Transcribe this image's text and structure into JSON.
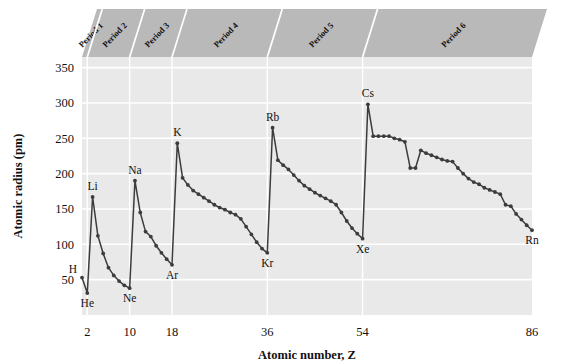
{
  "chart_data": {
    "type": "line",
    "title": "",
    "xlabel": "Atomic number, Z",
    "ylabel": "Atomic radius (pm)",
    "xlim": [
      1,
      86
    ],
    "ylim": [
      0,
      365
    ],
    "xticks": [
      2,
      10,
      18,
      36,
      54,
      86
    ],
    "xtick_labels": [
      "2",
      "10",
      "18",
      "36",
      "54",
      "86"
    ],
    "yticks": [
      50,
      100,
      150,
      200,
      250,
      300,
      350
    ],
    "ytick_labels": [
      "50",
      "100",
      "150",
      "200",
      "250",
      "300",
      "350"
    ],
    "grid": "horizontal-and-period-dividers",
    "legend": "none",
    "marker": "filled-circle",
    "line_color": "#3c3c3c",
    "plot_background": "#e9e9e9",
    "gridline_color": "#ffffff",
    "band_color": "#b9b9b9",
    "x": [
      1,
      2,
      3,
      4,
      5,
      6,
      7,
      8,
      9,
      10,
      11,
      12,
      13,
      14,
      15,
      16,
      17,
      18,
      19,
      20,
      21,
      22,
      23,
      24,
      25,
      26,
      27,
      28,
      29,
      30,
      31,
      32,
      33,
      34,
      35,
      36,
      37,
      38,
      39,
      40,
      41,
      42,
      43,
      44,
      45,
      46,
      47,
      48,
      49,
      50,
      51,
      52,
      53,
      54,
      55,
      56,
      57,
      58,
      59,
      60,
      61,
      62,
      63,
      64,
      65,
      66,
      67,
      68,
      69,
      70,
      71,
      72,
      73,
      74,
      75,
      76,
      77,
      78,
      79,
      80,
      81,
      82,
      83,
      84,
      85,
      86
    ],
    "values": [
      53,
      31,
      167,
      112,
      87,
      67,
      56,
      48,
      42,
      38,
      190,
      145,
      118,
      111,
      98,
      88,
      79,
      71,
      243,
      194,
      184,
      176,
      171,
      166,
      161,
      156,
      152,
      149,
      145,
      142,
      136,
      125,
      114,
      103,
      94,
      88,
      265,
      219,
      212,
      206,
      198,
      190,
      183,
      178,
      173,
      169,
      165,
      161,
      156,
      145,
      133,
      123,
      115,
      108,
      298,
      253,
      253,
      253,
      253,
      250,
      248,
      245,
      208,
      208,
      233,
      229,
      226,
      223,
      220,
      218,
      217,
      208,
      200,
      193,
      188,
      185,
      180,
      177,
      174,
      171,
      156,
      154,
      143,
      135,
      127,
      120
    ],
    "element_labels": [
      {
        "symbol": "H",
        "z": 1,
        "r": 53,
        "pos": "left"
      },
      {
        "symbol": "He",
        "z": 2,
        "r": 31,
        "pos": "below"
      },
      {
        "symbol": "Li",
        "z": 3,
        "r": 167,
        "pos": "above"
      },
      {
        "symbol": "Ne",
        "z": 10,
        "r": 38,
        "pos": "below"
      },
      {
        "symbol": "Na",
        "z": 11,
        "r": 190,
        "pos": "above"
      },
      {
        "symbol": "Ar",
        "z": 18,
        "r": 71,
        "pos": "below"
      },
      {
        "symbol": "K",
        "z": 19,
        "r": 243,
        "pos": "above"
      },
      {
        "symbol": "Kr",
        "z": 36,
        "r": 88,
        "pos": "below"
      },
      {
        "symbol": "Rb",
        "z": 37,
        "r": 265,
        "pos": "above"
      },
      {
        "symbol": "Xe",
        "z": 54,
        "r": 108,
        "pos": "below"
      },
      {
        "symbol": "Cs",
        "z": 55,
        "r": 298,
        "pos": "above"
      },
      {
        "symbol": "Rn",
        "z": 86,
        "r": 120,
        "pos": "below"
      }
    ],
    "period_bands": [
      {
        "label": "Period 1",
        "start_z": 1,
        "end_z": 2
      },
      {
        "label": "Period 2",
        "start_z": 2,
        "end_z": 10
      },
      {
        "label": "Period 3",
        "start_z": 10,
        "end_z": 18
      },
      {
        "label": "Period 4",
        "start_z": 18,
        "end_z": 36
      },
      {
        "label": "Period 5",
        "start_z": 36,
        "end_z": 54
      },
      {
        "label": "Period 6",
        "start_z": 54,
        "end_z": 86
      }
    ]
  }
}
